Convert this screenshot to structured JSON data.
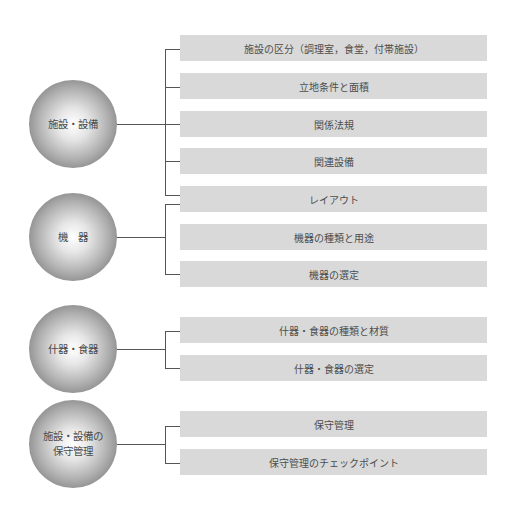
{
  "groups": [
    {
      "label": "施設・設備",
      "items": [
        "施設の区分（調理室，食堂，付帯施設）",
        "立地条件と面積",
        "関係法規",
        "関連設備",
        "レイアウト"
      ]
    },
    {
      "label": "機　器",
      "items": [
        "機器の種類と用途",
        "機器の選定"
      ]
    },
    {
      "label": "什器・食器",
      "items": [
        "什器・食器の種類と材質",
        "什器・食器の選定"
      ]
    },
    {
      "label": "施設・設備の\n保守管理",
      "items": [
        "保守管理",
        "保守管理のチェックポイント"
      ]
    }
  ],
  "colors": {
    "box": "#d9d9d9",
    "line": "#555555",
    "text": "#4d4d4d"
  }
}
